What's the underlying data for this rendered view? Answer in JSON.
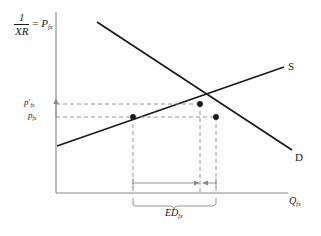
{
  "diagram": {
    "type": "supply-demand",
    "axes": {
      "y_label_fraction_numerator": "1",
      "y_label_fraction_denominator": "XR",
      "y_label_equals": "=",
      "y_label_price": "P",
      "y_label_price_sub": "fx",
      "x_label_quantity": "Q",
      "x_label_quantity_sub": "fx",
      "origin": {
        "x": 56,
        "y": 193
      },
      "y_axis_top": 12,
      "x_axis_right": 287
    },
    "curves": [
      {
        "name": "supply",
        "label": "S",
        "slope": "upward",
        "from": {
          "x": 57,
          "y": 146
        },
        "to": {
          "x": 284,
          "y": 67
        }
      },
      {
        "name": "demand",
        "label": "D",
        "slope": "downward",
        "from": {
          "x": 97,
          "y": 22
        },
        "to": {
          "x": 292,
          "y": 150
        }
      }
    ],
    "price_levels": [
      {
        "id": "price-high",
        "base": "p",
        "prime": "′",
        "sub": "fx",
        "y": 104,
        "dashed": true
      },
      {
        "id": "price-low",
        "base": "p",
        "prime": "",
        "sub": "fx",
        "y": 117,
        "dashed": true
      }
    ],
    "points": [
      {
        "name": "supply-at-low-price",
        "x": 133,
        "y": 117
      },
      {
        "name": "equilibrium",
        "x": 200,
        "y": 104
      },
      {
        "name": "demand-at-low-price",
        "x": 216,
        "y": 117
      }
    ],
    "verticals": [
      133,
      200,
      216
    ],
    "excess_demand": {
      "label_base": "ED",
      "label_sub": "fx",
      "brace_left": 133,
      "brace_right": 216,
      "brace_y": 200,
      "arrow_y": 183,
      "arrow_meet": 200
    },
    "y_axis_arrow": {
      "from_y": 117,
      "to_y": 100,
      "x": 56,
      "description": "upward arrow indicating price rise"
    },
    "colors": {
      "ink": "#1a1a1a",
      "axis": "#8a8a8a",
      "dashed": "#8a8a8a",
      "background": "#ffffff"
    }
  }
}
